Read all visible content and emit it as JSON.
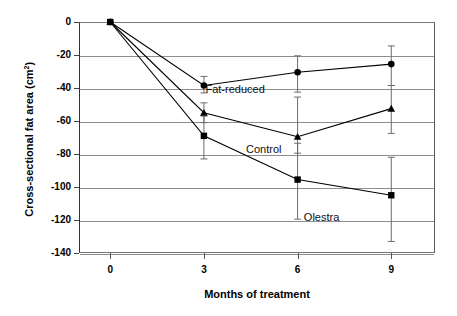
{
  "chart_data": {
    "type": "line",
    "title": "",
    "xlabel": "Months of treatment",
    "ylabel": "Cross-sectional fat area (cm",
    "ylabel_sup": "2",
    "ylabel_suffix": ")",
    "x": [
      0,
      3,
      6,
      9
    ],
    "xtick_labels": [
      "0",
      "3",
      "6",
      "9"
    ],
    "ytick_labels": [
      "0",
      "-20",
      "-40",
      "-60",
      "-80",
      "-100",
      "-120",
      "-140"
    ],
    "ytick_values": [
      0,
      -20,
      -40,
      -60,
      -80,
      -100,
      -120,
      -140
    ],
    "xlim": [
      -1,
      10.4
    ],
    "ylim": [
      -140,
      0
    ],
    "grid": "horizontal",
    "legend_position": "inline-annotations",
    "series": [
      {
        "name": "Fat-reduced",
        "marker": "circle",
        "values": [
          0,
          -38.5,
          -30.5,
          -25.5
        ],
        "err_low": [
          0,
          4.5,
          12.0,
          13.0
        ],
        "err_high": [
          0,
          5.5,
          10.0,
          11.0
        ]
      },
      {
        "name": "Control",
        "marker": "triangle",
        "values": [
          0,
          -55.0,
          -69.5,
          -52.5
        ],
        "err_low": [
          0,
          6.0,
          10.0,
          15.0
        ],
        "err_high": [
          0,
          6.0,
          24.0,
          14.0
        ]
      },
      {
        "name": "Olestra",
        "marker": "square",
        "values": [
          0,
          -69.0,
          -95.5,
          -105.0
        ],
        "err_low": [
          0,
          14.0,
          24.0,
          28.0
        ],
        "err_high": [
          0,
          12.0,
          22.0,
          23.0
        ]
      }
    ],
    "annotations": [
      {
        "text": "Fat-reduced",
        "x": 3.05,
        "y": -41.5
      },
      {
        "text": "Control",
        "x": 4.35,
        "y": -77.5
      },
      {
        "text": "Olestra",
        "x": 6.2,
        "y": -118.5
      }
    ],
    "colors": {
      "line": "#000000",
      "marker": "#000000",
      "grid": "#8e8e8e",
      "axis": "#444444",
      "errorbar": "#6b6b6b",
      "background": "#ffffff"
    }
  }
}
